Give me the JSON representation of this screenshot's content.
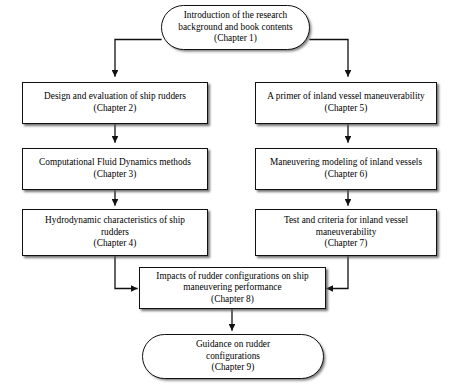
{
  "diagram": {
    "colors": {
      "background": "#ffffff",
      "stroke": "#111111",
      "text": "#000000"
    },
    "nodes": [
      {
        "id": "chapter1",
        "shape": "terminator",
        "text": "Introduction of the research\nbackground and book contents\n(Chapter 1)"
      },
      {
        "id": "chapter2",
        "shape": "process",
        "text": "Design and evaluation of ship rudders\n(Chapter 2)"
      },
      {
        "id": "chapter5",
        "shape": "process",
        "text": "A primer of inland vessel maneuverability\n(Chapter 5)"
      },
      {
        "id": "chapter3",
        "shape": "process",
        "text": "Computational Fluid Dynamics methods\n(Chapter 3)"
      },
      {
        "id": "chapter6",
        "shape": "process",
        "text": "Maneuvering modeling of inland vessels\n(Chapter 6)"
      },
      {
        "id": "chapter4",
        "shape": "process",
        "text": "Hydrodynamic characteristics of ship\nrudders\n(Chapter 4)"
      },
      {
        "id": "chapter7",
        "shape": "process",
        "text": "Test and criteria for inland vessel\nmaneuverability\n(Chapter 7)"
      },
      {
        "id": "chapter8",
        "shape": "process",
        "text": "Impacts of rudder configurations on ship\nmaneuvering performance\n(Chapter 8)"
      },
      {
        "id": "chapter9",
        "shape": "terminator",
        "text": "Guidance on rudder\nconfigurations\n(Chapter 9)"
      }
    ],
    "edges": [
      {
        "from": "chapter1",
        "to": "chapter2",
        "style": "elbow-left"
      },
      {
        "from": "chapter1",
        "to": "chapter5",
        "style": "elbow-right"
      },
      {
        "from": "chapter2",
        "to": "chapter3",
        "style": "straight-down"
      },
      {
        "from": "chapter3",
        "to": "chapter4",
        "style": "straight-down"
      },
      {
        "from": "chapter5",
        "to": "chapter6",
        "style": "straight-down"
      },
      {
        "from": "chapter6",
        "to": "chapter7",
        "style": "straight-down"
      },
      {
        "from": "chapter4",
        "to": "chapter8",
        "style": "elbow-down-right"
      },
      {
        "from": "chapter7",
        "to": "chapter8",
        "style": "elbow-down-left"
      },
      {
        "from": "chapter8",
        "to": "chapter9",
        "style": "straight-down"
      }
    ]
  }
}
